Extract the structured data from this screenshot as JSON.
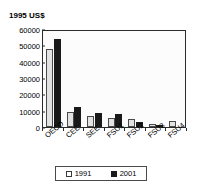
{
  "axis_label": "1995 US$",
  "legend": {
    "entries": [
      {
        "label": "1991",
        "swatch": "light-swatch"
      },
      {
        "label": "2001",
        "swatch": "dark-swatch"
      }
    ]
  },
  "chart_data": {
    "type": "bar",
    "title": "",
    "xlabel": "",
    "ylabel": "1995 US$",
    "ylim": [
      0,
      60000
    ],
    "yticks": [
      0,
      10000,
      20000,
      30000,
      40000,
      50000,
      60000
    ],
    "ytick_labels": [
      "0",
      "10000",
      "20000",
      "30000",
      "40000",
      "50000",
      "60000"
    ],
    "grid": false,
    "legend_position": "bottom",
    "categories": [
      "OECD",
      "CEE",
      "SEE",
      "FSU1",
      "FSU2",
      "FSU3",
      "FSU4"
    ],
    "series": [
      {
        "name": "1991",
        "color": "#e3e3e3",
        "values": [
          47500,
          9000,
          6500,
          5500,
          5000,
          1800,
          3800
        ]
      },
      {
        "name": "2001",
        "color": "#1a1a1a",
        "values": [
          54000,
          12500,
          8500,
          8000,
          3300,
          1500,
          null
        ]
      }
    ]
  }
}
